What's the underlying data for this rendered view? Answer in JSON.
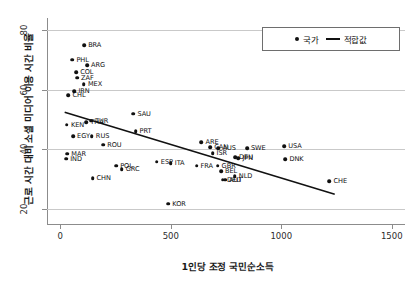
{
  "chart_data": {
    "type": "scatter",
    "title": "",
    "xlabel": "1인당 조정 국민순소득",
    "ylabel": "근로 시간 대비 소셜 미디어 이용 시간 비율",
    "xlim": [
      -60,
      1560
    ],
    "ylim": [
      15,
      84
    ],
    "xticks": [
      0,
      500,
      1000,
      1500
    ],
    "xtick_labels": [
      "0",
      "500",
      "1000",
      "1500"
    ],
    "yticks": [
      20,
      40,
      60,
      80
    ],
    "ytick_labels": [
      "20",
      "40",
      "60",
      "80"
    ],
    "grid": "horizontal",
    "legend_position": "top-right",
    "legend": [
      {
        "label": "국가",
        "marker": "dot"
      },
      {
        "label": "적합값",
        "marker": "line"
      }
    ],
    "series": [
      {
        "name": "국가",
        "marker": "dot",
        "points": [
          {
            "label": "BRA",
            "x": 108,
            "y": 74.8
          },
          {
            "label": "PHL",
            "x": 55,
            "y": 70.0
          },
          {
            "label": "ARG",
            "x": 121,
            "y": 68.2
          },
          {
            "label": "COL",
            "x": 72,
            "y": 65.8
          },
          {
            "label": "ZAF",
            "x": 76,
            "y": 64.0
          },
          {
            "label": "MEX",
            "x": 107,
            "y": 61.8
          },
          {
            "label": "IRN",
            "x": 64,
            "y": 59.4
          },
          {
            "label": "CHL",
            "x": 37,
            "y": 58.2
          },
          {
            "label": "TUR",
            "x": 139,
            "y": 49.6
          },
          {
            "label": "THA",
            "x": 118,
            "y": 49.1
          },
          {
            "label": "KEN",
            "x": 30,
            "y": 48.2
          },
          {
            "label": "SAU",
            "x": 331,
            "y": 51.9
          },
          {
            "label": "PRT",
            "x": 341,
            "y": 46.1
          },
          {
            "label": "EGY",
            "x": 58,
            "y": 44.5
          },
          {
            "label": "RUS",
            "x": 143,
            "y": 44.4
          },
          {
            "label": "ROU",
            "x": 194,
            "y": 41.6
          },
          {
            "label": "ARE",
            "x": 639,
            "y": 42.3
          },
          {
            "label": "CAN",
            "x": 679,
            "y": 40.7
          },
          {
            "label": "AUS",
            "x": 716,
            "y": 40.4
          },
          {
            "label": "SWE",
            "x": 845,
            "y": 40.4
          },
          {
            "label": "USA",
            "x": 1014,
            "y": 41.1
          },
          {
            "label": "ISR",
            "x": 689,
            "y": 38.8
          },
          {
            "label": "DEU",
            "x": 791,
            "y": 37.4
          },
          {
            "label": "JPN",
            "x": 806,
            "y": 37.1
          },
          {
            "label": "DNK",
            "x": 1019,
            "y": 36.8
          },
          {
            "label": "MAR",
            "x": 32,
            "y": 38.6
          },
          {
            "label": "IND",
            "x": 27,
            "y": 36.9
          },
          {
            "label": "ESP",
            "x": 437,
            "y": 35.9
          },
          {
            "label": "ITA",
            "x": 500,
            "y": 35.3
          },
          {
            "label": "FRA",
            "x": 617,
            "y": 34.5
          },
          {
            "label": "GBR",
            "x": 712,
            "y": 34.5
          },
          {
            "label": "POL",
            "x": 253,
            "y": 34.5
          },
          {
            "label": "GRC",
            "x": 278,
            "y": 33.4
          },
          {
            "label": "BEL",
            "x": 727,
            "y": 32.6
          },
          {
            "label": "NLD",
            "x": 790,
            "y": 31.1
          },
          {
            "label": "AUT",
            "x": 746,
            "y": 29.9
          },
          {
            "label": "DEU2",
            "x": 736,
            "y": 29.8
          },
          {
            "label": "CHN",
            "x": 146,
            "y": 30.3
          },
          {
            "label": "CHE",
            "x": 1218,
            "y": 29.3
          },
          {
            "label": "KOR",
            "x": 489,
            "y": 21.8
          }
        ]
      }
    ],
    "fit_line": {
      "name": "적합값",
      "x0": 20,
      "y0": 52.4,
      "x1": 1242,
      "y1": 25.0
    }
  }
}
